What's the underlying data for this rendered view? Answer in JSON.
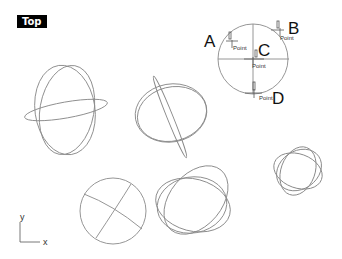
{
  "viewport": {
    "label": "Top"
  },
  "callouts": [
    {
      "id": "A",
      "label": "A",
      "point_label": "Point"
    },
    {
      "id": "B",
      "label": "B",
      "point_label": "Point"
    },
    {
      "id": "C",
      "label": "C",
      "point_label": "Point"
    },
    {
      "id": "D",
      "label": "D",
      "point_label": "Point"
    }
  ],
  "axes": {
    "y_label": "y",
    "x_label": "x"
  },
  "colors": {
    "curve": "#8a8a8a",
    "label_bg": "#000000",
    "label_text": "#ffffff"
  }
}
